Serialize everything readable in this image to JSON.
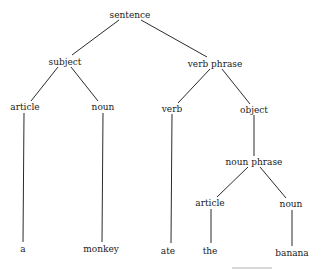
{
  "diagram": {
    "type": "parse-tree",
    "root": "sentence",
    "nodes": {
      "sentence": {
        "label": "sentence",
        "x": 130,
        "y": 10
      },
      "subject": {
        "label": "subject",
        "x": 65,
        "y": 57
      },
      "verb_phrase": {
        "label": "verb phrase",
        "x": 215,
        "y": 59
      },
      "article_1": {
        "label": "article",
        "x": 25,
        "y": 102
      },
      "noun_1": {
        "label": "noun",
        "x": 103,
        "y": 102
      },
      "verb": {
        "label": "verb",
        "x": 172,
        "y": 104
      },
      "object": {
        "label": "object",
        "x": 254,
        "y": 105
      },
      "noun_phrase": {
        "label": "noun phrase",
        "x": 254,
        "y": 157
      },
      "article_2": {
        "label": "article",
        "x": 210,
        "y": 198
      },
      "noun_2": {
        "label": "noun",
        "x": 291,
        "y": 199
      },
      "word_a": {
        "label": "a",
        "x": 23,
        "y": 244
      },
      "word_monkey": {
        "label": "monkey",
        "x": 101,
        "y": 244
      },
      "word_ate": {
        "label": "ate",
        "x": 168,
        "y": 246
      },
      "word_the": {
        "label": "the",
        "x": 210,
        "y": 246
      },
      "word_banana": {
        "label": "banana",
        "x": 292,
        "y": 248
      }
    },
    "edges": [
      [
        "sentence",
        "subject"
      ],
      [
        "sentence",
        "verb_phrase"
      ],
      [
        "subject",
        "article_1"
      ],
      [
        "subject",
        "noun_1"
      ],
      [
        "verb_phrase",
        "verb"
      ],
      [
        "verb_phrase",
        "object"
      ],
      [
        "article_1",
        "word_a"
      ],
      [
        "noun_1",
        "word_monkey"
      ],
      [
        "verb",
        "word_ate"
      ],
      [
        "object",
        "noun_phrase"
      ],
      [
        "noun_phrase",
        "article_2"
      ],
      [
        "noun_phrase",
        "noun_2"
      ],
      [
        "article_2",
        "word_the"
      ],
      [
        "noun_2",
        "word_banana"
      ]
    ]
  }
}
